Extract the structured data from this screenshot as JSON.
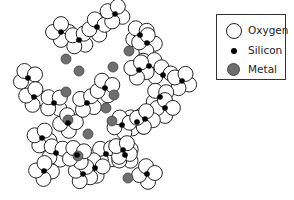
{
  "legend": {
    "items": [
      {
        "label": "Oxygen",
        "symbol": "open-circle",
        "color": "#ffffff",
        "stroke": "#222222"
      },
      {
        "label": "Silicon",
        "symbol": "small-black-dot",
        "color": "#000000"
      },
      {
        "label": "Metal",
        "symbol": "gray-circle",
        "color": "#6e6e6e"
      }
    ]
  },
  "diagram": {
    "oxygen_radius": 7.5,
    "colors": {
      "oxygen_fill": "#ffffff",
      "oxygen_stroke": "#222222",
      "silicon": "#000000",
      "metal": "#6e6e6e"
    },
    "silicon": [
      [
        61,
        32
      ],
      [
        79,
        40
      ],
      [
        97,
        27
      ],
      [
        115,
        14
      ],
      [
        140,
        35
      ],
      [
        147,
        43
      ],
      [
        149,
        66
      ],
      [
        163,
        75
      ],
      [
        182,
        81
      ],
      [
        28,
        78
      ],
      [
        34,
        97
      ],
      [
        54,
        103
      ],
      [
        68,
        123
      ],
      [
        87,
        103
      ],
      [
        105,
        88
      ],
      [
        139,
        70
      ],
      [
        160,
        97
      ],
      [
        165,
        108
      ],
      [
        137,
        122
      ],
      [
        122,
        125
      ],
      [
        42,
        138
      ],
      [
        56,
        153
      ],
      [
        44,
        171
      ],
      [
        106,
        154
      ],
      [
        95,
        168
      ],
      [
        83,
        174
      ],
      [
        77,
        155
      ],
      [
        145,
        119
      ],
      [
        125,
        155
      ],
      [
        147,
        174
      ],
      [
        123,
        150
      ]
    ],
    "metal": [
      [
        66,
        59
      ],
      [
        79,
        71
      ],
      [
        129,
        51
      ],
      [
        113,
        67
      ],
      [
        114,
        95
      ],
      [
        112,
        121
      ],
      [
        68,
        120
      ],
      [
        78,
        156
      ],
      [
        88,
        134
      ],
      [
        106,
        108
      ],
      [
        128,
        178
      ],
      [
        66,
        92
      ]
    ]
  }
}
